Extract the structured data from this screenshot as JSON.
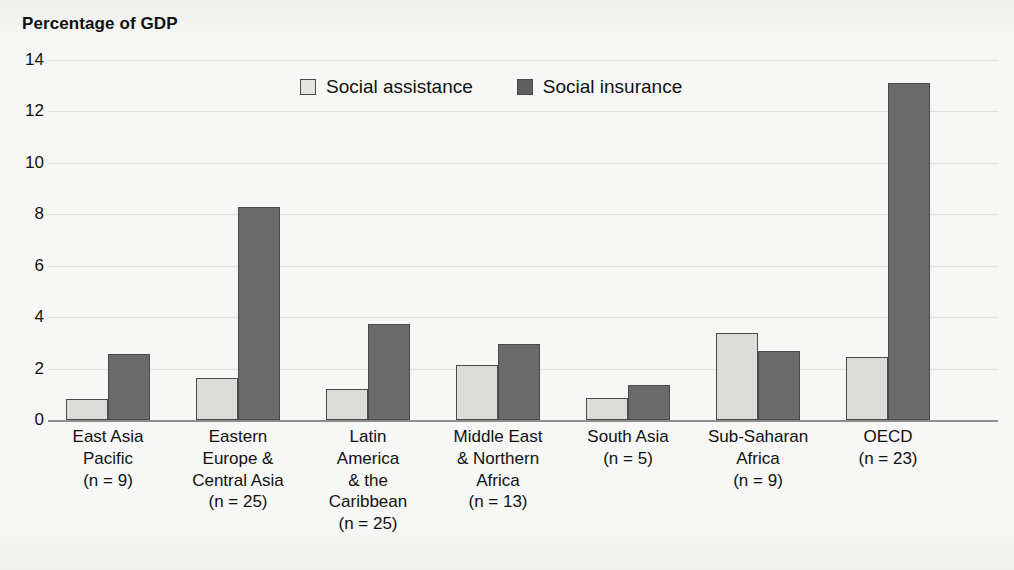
{
  "chart_data": {
    "type": "bar",
    "title": "Percentage of GDP",
    "xlabel": "",
    "ylabel": "Percentage of GDP",
    "ylim": [
      0,
      14
    ],
    "yticks": [
      0,
      2,
      4,
      6,
      8,
      10,
      12,
      14
    ],
    "grid": true,
    "legend_position": "top-center",
    "categories": [
      "East Asia Pacific (n = 9)",
      "Eastern Europe & Central Asia (n = 25)",
      "Latin America & the Caribbean (n = 25)",
      "Middle East & Northern Africa (n = 13)",
      "South Asia (n = 5)",
      "Sub-Saharan Africa (n = 9)",
      "OECD (n = 23)"
    ],
    "category_lines": [
      [
        "East Asia",
        "Pacific",
        "(n = 9)"
      ],
      [
        "Eastern",
        "Europe &",
        "Central Asia",
        "(n = 25)"
      ],
      [
        "Latin",
        "America",
        "& the",
        "Caribbean",
        "(n = 25)"
      ],
      [
        "Middle East",
        "& Northern",
        "Africa",
        "(n = 13)"
      ],
      [
        "South Asia",
        "(n = 5)"
      ],
      [
        "Sub-Saharan",
        "Africa",
        "(n = 9)"
      ],
      [
        "OECD",
        "(n = 23)"
      ]
    ],
    "series": [
      {
        "name": "Social assistance",
        "color": "#dcdcd8",
        "values": [
          0.8,
          1.65,
          1.2,
          2.15,
          0.85,
          3.4,
          2.45
        ]
      },
      {
        "name": "Social insurance",
        "color": "#6a6a6a",
        "values": [
          2.55,
          8.3,
          3.75,
          2.95,
          1.35,
          2.7,
          13.1
        ]
      }
    ]
  },
  "legend": {
    "items": [
      {
        "label": "Social assistance",
        "swatch": "assistance"
      },
      {
        "label": "Social insurance",
        "swatch": "insurance"
      }
    ]
  },
  "yticks_text": [
    "14",
    "12",
    "10",
    "8",
    "6",
    "4",
    "2",
    "0"
  ]
}
